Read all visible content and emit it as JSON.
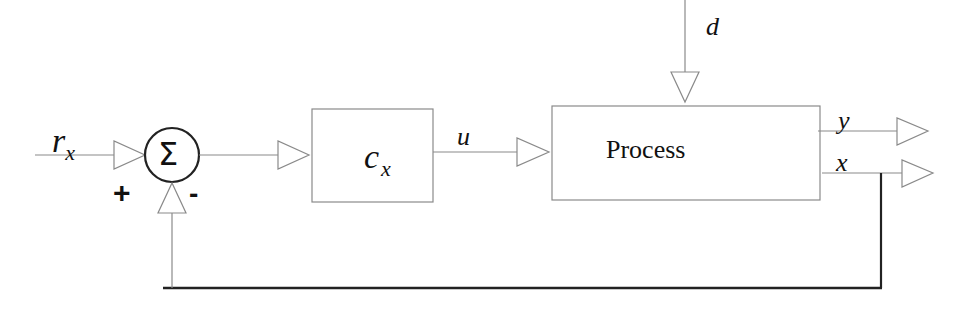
{
  "diagram": {
    "type": "feedback-control-block-diagram",
    "signals": {
      "reference": {
        "main": "r",
        "subscript": "x"
      },
      "control": "u",
      "disturbance": "d",
      "output_y": "y",
      "output_x": "x"
    },
    "summing_junction": {
      "symbol": "Σ",
      "plus_sign": "+",
      "minus_sign": "-"
    },
    "blocks": {
      "controller": {
        "main": "c",
        "subscript": "x"
      },
      "process": {
        "label": "Process"
      }
    },
    "colors": {
      "thin_line": "#8a8a8a",
      "thick_line": "#222222",
      "text": "#111111",
      "background": "#ffffff"
    }
  }
}
